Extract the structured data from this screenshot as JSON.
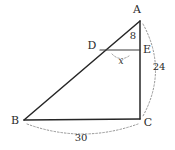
{
  "figure": {
    "background_color": "#ffffff",
    "line_color": "#262626",
    "dashed_color": "#8a8a8a",
    "text_color": "#2b2b2b"
  },
  "vertices": {
    "a": {
      "label": "A",
      "x": 140,
      "y": 21
    },
    "b": {
      "label": "B",
      "x": 24,
      "y": 120
    },
    "c": {
      "label": "C",
      "x": 140,
      "y": 119
    },
    "d": {
      "label": "D",
      "x": 100,
      "y": 50
    },
    "e": {
      "label": "E",
      "x": 140,
      "y": 50
    }
  },
  "measures": {
    "ae": "8",
    "ec": "24",
    "bc": "30",
    "angle_d": "x"
  }
}
